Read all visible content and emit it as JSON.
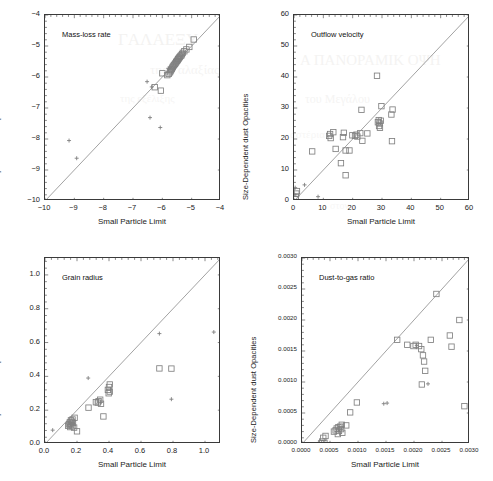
{
  "figure": {
    "width": 493,
    "height": 481,
    "background": "#ffffff",
    "marker_color": "#808080",
    "line_color": "#7a7a7a",
    "axis_color": "#3a3a3a",
    "bleed_through_text": [
      {
        "text": "ΓAΛAEΞY",
        "x": 118,
        "y": 30,
        "size": 17,
        "opacity": 0.3
      },
      {
        "text": "A ΠANOPAMIK OΨH",
        "x": 300,
        "y": 52,
        "size": 15,
        "opacity": 0.28
      },
      {
        "text": "της Γαλαξίας",
        "x": 150,
        "y": 62,
        "size": 13,
        "opacity": 0.26
      },
      {
        "text": "του Μεγάλου",
        "x": 305,
        "y": 92,
        "size": 12,
        "opacity": 0.26
      },
      {
        "text": "της εξέλιξης",
        "x": 120,
        "y": 92,
        "size": 11,
        "opacity": 0.24
      },
      {
        "text": "αστέρια",
        "x": 290,
        "y": 128,
        "size": 11,
        "opacity": 0.22
      },
      {
        "text": "στον",
        "x": 330,
        "y": 200,
        "size": 10,
        "opacity": 0.2
      }
    ]
  },
  "chart_data": [
    {
      "id": "mass-loss-rate",
      "type": "scatter",
      "title": "Mass-loss rate",
      "xlabel": "Small Particle Limit",
      "ylabel": "Size-Dependent dust Opacities",
      "xlim": [
        -10,
        -4
      ],
      "ylim": [
        -10,
        -4
      ],
      "xticks": [
        -10,
        -9,
        -8,
        -7,
        -6,
        -5,
        -4
      ],
      "xticklabels": [
        "−10",
        "−9",
        "−8",
        "−7",
        "−6",
        "−5",
        "−4"
      ],
      "yticks": [
        -10,
        -9,
        -8,
        -7,
        -6,
        -5,
        -4
      ],
      "yticklabels": [
        "−10",
        "−9",
        "−8",
        "−7",
        "−6",
        "−5",
        "−4"
      ],
      "grid": false,
      "legend": "none",
      "identity_line": true,
      "series": [
        {
          "name": "squares",
          "marker": "square",
          "points": [
            [
              -4.93,
              -4.79
            ],
            [
              -5.08,
              -5.03
            ],
            [
              -5.18,
              -5.11
            ],
            [
              -5.25,
              -5.17
            ],
            [
              -5.3,
              -5.22
            ],
            [
              -5.33,
              -5.26
            ],
            [
              -5.35,
              -5.3
            ],
            [
              -5.38,
              -5.32
            ],
            [
              -5.4,
              -5.35
            ],
            [
              -5.42,
              -5.37
            ],
            [
              -5.44,
              -5.4
            ],
            [
              -5.46,
              -5.42
            ],
            [
              -5.47,
              -5.44
            ],
            [
              -5.49,
              -5.47
            ],
            [
              -5.51,
              -5.49
            ],
            [
              -5.53,
              -5.52
            ],
            [
              -5.55,
              -5.55
            ],
            [
              -5.57,
              -5.58
            ],
            [
              -5.6,
              -5.61
            ],
            [
              -5.62,
              -5.64
            ],
            [
              -5.64,
              -5.67
            ],
            [
              -5.66,
              -5.7
            ],
            [
              -5.68,
              -5.74
            ],
            [
              -5.7,
              -5.77
            ],
            [
              -5.72,
              -5.81
            ],
            [
              -5.74,
              -5.85
            ],
            [
              -5.78,
              -5.9
            ],
            [
              -5.83,
              -5.94
            ],
            [
              -6.0,
              -5.88
            ],
            [
              -6.26,
              -6.33
            ],
            [
              -6.05,
              -6.44
            ]
          ]
        },
        {
          "name": "plus",
          "marker": "plus",
          "points": [
            [
              -9.18,
              -8.05
            ],
            [
              -8.92,
              -8.62
            ],
            [
              -6.42,
              -7.31
            ],
            [
              -6.07,
              -7.63
            ],
            [
              -6.36,
              -6.32
            ],
            [
              -6.52,
              -6.15
            ],
            [
              -5.8,
              -5.72
            ]
          ]
        }
      ]
    },
    {
      "id": "outflow-velocity",
      "type": "scatter",
      "title": "Outflow velocity",
      "xlabel": "Small Particle Limit",
      "ylabel": "Size-Dependent dust Opacities",
      "xlim": [
        0,
        60
      ],
      "ylim": [
        0,
        60
      ],
      "xticks": [
        0,
        10,
        20,
        30,
        40,
        50,
        60
      ],
      "xticklabels": [
        "0",
        "10",
        "20",
        "30",
        "40",
        "50",
        "60"
      ],
      "yticks": [
        0,
        10,
        20,
        30,
        40,
        50,
        60
      ],
      "yticklabels": [
        "0",
        "10",
        "20",
        "30",
        "40",
        "50",
        "60"
      ],
      "grid": false,
      "legend": "none",
      "identity_line": true,
      "series": [
        {
          "name": "squares",
          "marker": "square",
          "points": [
            [
              28.3,
              40.4
            ],
            [
              29.8,
              30.6
            ],
            [
              23.0,
              29.4
            ],
            [
              33.6,
              29.5
            ],
            [
              33.2,
              27.9
            ],
            [
              28.9,
              26.1
            ],
            [
              29.6,
              25.9
            ],
            [
              28.6,
              25.4
            ],
            [
              29.2,
              25.0
            ],
            [
              29.0,
              24.2
            ],
            [
              29.3,
              23.6
            ],
            [
              25.0,
              21.8
            ],
            [
              22.6,
              21.9
            ],
            [
              21.3,
              21.4
            ],
            [
              20.8,
              21.0
            ],
            [
              19.9,
              21.2
            ],
            [
              17.0,
              22.0
            ],
            [
              12.3,
              21.6
            ],
            [
              13.4,
              22.2
            ],
            [
              12.0,
              21.0
            ],
            [
              12.5,
              20.3
            ],
            [
              16.7,
              20.6
            ],
            [
              21.6,
              20.8
            ],
            [
              23.3,
              19.4
            ],
            [
              33.4,
              19.3
            ],
            [
              14.2,
              16.8
            ],
            [
              17.6,
              16.3
            ],
            [
              18.9,
              16.3
            ],
            [
              6.2,
              16.0
            ],
            [
              16.0,
              12.2
            ],
            [
              17.6,
              8.3
            ],
            [
              1.0,
              3.2
            ],
            [
              0.8,
              2.4
            ],
            [
              0.6,
              1.3
            ],
            [
              0.5,
              0.6
            ]
          ]
        },
        {
          "name": "plus",
          "marker": "plus",
          "points": [
            [
              3.6,
              5.2
            ],
            [
              8.2,
              1.4
            ],
            [
              0.4,
              4.3
            ],
            [
              0.3,
              2.0
            ],
            [
              28.9,
              25.0
            ]
          ]
        }
      ]
    },
    {
      "id": "grain-radius",
      "type": "scatter",
      "title": "Grain radius",
      "xlabel": "Small Particle Limit",
      "ylabel": "Size-Dependent dust Opacities",
      "xlim": [
        0.0,
        1.1
      ],
      "ylim": [
        0.0,
        1.1
      ],
      "xticks": [
        0.0,
        0.2,
        0.4,
        0.6,
        0.8,
        1.0
      ],
      "xticklabels": [
        "0.0",
        "0.2",
        "0.4",
        "0.6",
        "0.8",
        "1.0"
      ],
      "yticks": [
        0.0,
        0.2,
        0.4,
        0.6,
        0.8,
        1.0
      ],
      "yticklabels": [
        "0.0",
        "0.2",
        "0.4",
        "0.6",
        "0.8",
        "1.0"
      ],
      "grid": false,
      "legend": "none",
      "identity_line": true,
      "series": [
        {
          "name": "squares",
          "marker": "square",
          "points": [
            [
              0.715,
              0.447
            ],
            [
              0.79,
              0.446
            ],
            [
              0.405,
              0.352
            ],
            [
              0.4,
              0.337
            ],
            [
              0.393,
              0.32
            ],
            [
              0.405,
              0.31
            ],
            [
              0.398,
              0.3
            ],
            [
              0.345,
              0.262
            ],
            [
              0.335,
              0.253
            ],
            [
              0.33,
              0.245
            ],
            [
              0.318,
              0.247
            ],
            [
              0.35,
              0.238
            ],
            [
              0.272,
              0.215
            ],
            [
              0.365,
              0.163
            ],
            [
              0.185,
              0.155
            ],
            [
              0.172,
              0.145
            ],
            [
              0.162,
              0.14
            ],
            [
              0.168,
              0.132
            ],
            [
              0.155,
              0.128
            ],
            [
              0.175,
              0.125
            ],
            [
              0.16,
              0.12
            ],
            [
              0.15,
              0.116
            ],
            [
              0.165,
              0.112
            ],
            [
              0.145,
              0.108
            ],
            [
              0.172,
              0.105
            ],
            [
              0.158,
              0.1
            ],
            [
              0.182,
              0.097
            ],
            [
              0.2,
              0.075
            ]
          ]
        },
        {
          "name": "plus",
          "marker": "plus",
          "points": [
            [
              0.715,
              0.653
            ],
            [
              1.055,
              0.662
            ],
            [
              0.79,
              0.265
            ],
            [
              0.27,
              0.39
            ],
            [
              0.048,
              0.082
            ],
            [
              0.165,
              0.118
            ]
          ]
        }
      ]
    },
    {
      "id": "dust-to-gas-ratio",
      "type": "scatter",
      "title": "Dust-to-gas ratio",
      "xlabel": "Small Particle Limit",
      "ylabel": "Size-Dependent dust Opacities",
      "xlim": [
        0.0,
        0.003
      ],
      "ylim": [
        0.0,
        0.003
      ],
      "xticks": [
        0.0,
        0.0005,
        0.001,
        0.0015,
        0.002,
        0.0025,
        0.003
      ],
      "xticklabels": [
        "0.0000",
        "0.0005",
        "0.0010",
        "0.0015",
        "0.0020",
        "0.0025",
        "0.0030"
      ],
      "yticks": [
        0.0,
        0.0005,
        0.001,
        0.0015,
        0.002,
        0.0025,
        0.003
      ],
      "yticklabels": [
        "0.0000",
        "0.0005",
        "0.0010",
        "0.0015",
        "0.0020",
        "0.0025",
        "0.0030"
      ],
      "grid": false,
      "legend": "none",
      "identity_line": true,
      "series": [
        {
          "name": "squares",
          "marker": "square",
          "points": [
            [
              0.0024,
              0.00242
            ],
            [
              0.00281,
              0.002
            ],
            [
              0.00264,
              0.00175
            ],
            [
              0.0023,
              0.00168
            ],
            [
              0.0017,
              0.00168
            ],
            [
              0.00267,
              0.00157
            ],
            [
              0.00203,
              0.0016
            ],
            [
              0.00188,
              0.0016
            ],
            [
              0.00199,
              0.00158
            ],
            [
              0.00209,
              0.00158
            ],
            [
              0.00213,
              0.00153
            ],
            [
              0.00216,
              0.00143
            ],
            [
              0.00218,
              0.00133
            ],
            [
              0.0022,
              0.00118
            ],
            [
              0.00214,
              0.00096
            ],
            [
              0.0029,
              0.00061
            ],
            [
              0.00098,
              0.00067
            ],
            [
              0.00086,
              0.00051
            ],
            [
              0.00071,
              0.00031
            ],
            [
              0.00079,
              0.0003
            ],
            [
              0.00068,
              0.00028
            ],
            [
              0.00065,
              0.00027
            ],
            [
              0.00062,
              0.00025
            ],
            [
              0.0007,
              0.00024
            ],
            [
              0.0006,
              0.00022
            ],
            [
              0.00066,
              0.00021
            ],
            [
              0.00057,
              0.0002
            ],
            [
              0.00072,
              0.00018
            ],
            [
              0.00064,
              0.00016
            ],
            [
              0.00042,
              0.00013
            ],
            [
              0.00038,
              0.0001
            ],
            [
              0.00036,
              4e-05
            ],
            [
              0.0004,
              2e-05
            ],
            [
              0.00034,
              1e-05
            ]
          ]
        },
        {
          "name": "plus",
          "marker": "plus",
          "points": [
            [
              0.00225,
              0.00097
            ],
            [
              0.00146,
              0.00065
            ],
            [
              0.00152,
              0.00066
            ],
            [
              0.003,
              0.00202
            ],
            [
              0.00205,
              0.00159
            ]
          ]
        }
      ]
    }
  ]
}
